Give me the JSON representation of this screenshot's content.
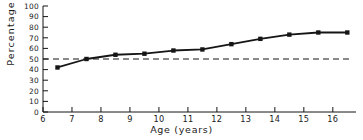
{
  "chart_data": {
    "type": "line",
    "title": "",
    "subtitle": "",
    "xlabel": "Age (years)",
    "ylabel": "Percentage",
    "xlim": [
      6,
      16.8
    ],
    "ylim": [
      0,
      100
    ],
    "xticks": [
      6,
      7,
      8,
      9,
      10,
      11,
      12,
      13,
      14,
      15,
      16
    ],
    "xticklabels": [
      "6",
      "7",
      "8",
      "9",
      "10",
      "11",
      "12",
      "13",
      "14",
      "15",
      "16"
    ],
    "yticks": [
      0,
      10,
      20,
      30,
      40,
      50,
      60,
      70,
      80,
      90,
      100
    ],
    "yticklabels": [
      "0",
      "10",
      "20",
      "30",
      "40",
      "50",
      "60",
      "70",
      "80",
      "90",
      "100"
    ],
    "grid": false,
    "legend": null,
    "legend_position": "none",
    "marker": "square",
    "line_color": "#151515",
    "marker_color": "#151515",
    "series": [
      {
        "name": "Percentage",
        "x": [
          6.5,
          7.5,
          8.5,
          9.5,
          10.5,
          11.5,
          12.5,
          13.5,
          14.5,
          15.5,
          16.5
        ],
        "values": [
          42,
          50,
          54,
          55,
          58,
          59,
          64,
          69,
          73,
          75,
          75
        ]
      }
    ],
    "annotations": [
      {
        "type": "hline",
        "name": "reference-line-50",
        "y": 50,
        "style": "dashed",
        "color": "#151515",
        "label": "50"
      }
    ]
  }
}
